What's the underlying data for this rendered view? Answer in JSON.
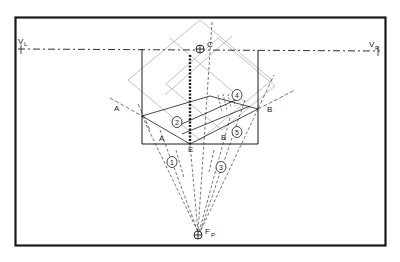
{
  "diagram": {
    "type": "two-point perspective construction",
    "labels": {
      "vanishing_left": "V",
      "vanishing_left_sub": "L",
      "vanishing_right": "V",
      "vanishing_right_sub": "R",
      "center": "C",
      "station_point": "F",
      "station_point_sub": "P",
      "point_e": "E",
      "a_outer": "A",
      "a_inner": "A",
      "b_outer": "B",
      "b_inner": "B"
    },
    "steps": [
      "1",
      "2",
      "3",
      "4",
      "5"
    ],
    "colors": {
      "ink": "#1a1a1a",
      "construction": "#9a9a9a",
      "background": "#ffffff"
    }
  }
}
